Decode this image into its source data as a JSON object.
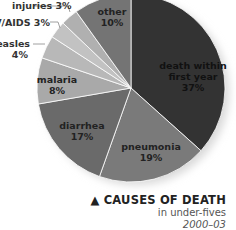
{
  "chart_data": {
    "type": "pie",
    "title": "CAUSES OF DEATH",
    "subtitle": "in under-fives",
    "period": "2000–03",
    "slices": [
      {
        "label": "death within first year",
        "value": 37,
        "display": "37%",
        "color": "#333333"
      },
      {
        "label": "pneumonia",
        "value": 19,
        "display": "19%",
        "color": "#7a7a7a"
      },
      {
        "label": "diarrhea",
        "value": 17,
        "display": "17%",
        "color": "#6a6a6a"
      },
      {
        "label": "malaria",
        "value": 8,
        "display": "8%",
        "color": "#a9a9a9"
      },
      {
        "label": "measles",
        "value": 4,
        "display": "4%",
        "color": "#b8b8b8"
      },
      {
        "label": "HIV/AIDS",
        "value": 3,
        "display": "3%",
        "color": "#c2c2c2"
      },
      {
        "label": "injuries",
        "value": 3,
        "display": "3%",
        "color": "#b0b0b0"
      },
      {
        "label": "other",
        "value": 10,
        "display": "10%",
        "color": "#747474"
      }
    ],
    "legend": "none (direct labels)"
  },
  "labels": {
    "death_line1": "death within",
    "death_line2": "first year",
    "death_pct": "37%",
    "pneumonia": "pneumonia",
    "pneumonia_pct": "19%",
    "diarrhea": "diarrhea",
    "diarrhea_pct": "17%",
    "malaria": "malaria",
    "malaria_pct": "8%",
    "measles": "measles",
    "measles_pct": "4%",
    "hiv": "HIV/AIDS 3%",
    "injuries": "injuries 3%",
    "other": "other",
    "other_pct": "10%"
  },
  "caption": {
    "title": "▲ CAUSES OF DEATH",
    "subtitle": "in under-fives",
    "date": "2000–03"
  }
}
